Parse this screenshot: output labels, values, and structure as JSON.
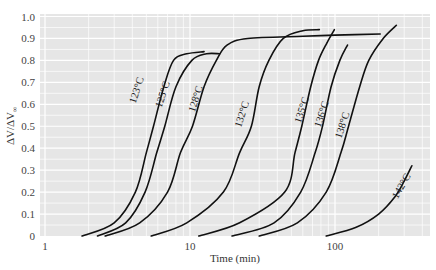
{
  "chart_data": {
    "type": "line",
    "title": "",
    "xlabel": "Time (min)",
    "ylabel": "ΔV/ΔV∞",
    "xscale": "log",
    "xlim": [
      0.92,
      490
    ],
    "ylim": [
      0,
      1.0
    ],
    "x_ticks": [
      {
        "value": 1,
        "label": "1"
      },
      {
        "value": 10,
        "label": "10"
      },
      {
        "value": 100,
        "label": "100"
      }
    ],
    "y_ticks": [
      {
        "value": 0,
        "label": "0"
      },
      {
        "value": 0.1,
        "label": "0.1"
      },
      {
        "value": 0.2,
        "label": "0.2"
      },
      {
        "value": 0.3,
        "label": "0.3"
      },
      {
        "value": 0.4,
        "label": "0.4"
      },
      {
        "value": 0.5,
        "label": "0.5"
      },
      {
        "value": 0.6,
        "label": "0.6"
      },
      {
        "value": 0.7,
        "label": "0.7"
      },
      {
        "value": 0.8,
        "label": "0.8"
      },
      {
        "value": 0.9,
        "label": "0.9"
      },
      {
        "value": 1.0,
        "label": "1.0"
      }
    ],
    "grid": true,
    "legend": "none (curves labeled inline)",
    "series": [
      {
        "name": "123°C",
        "label_pos": {
          "t": 4.5,
          "v": 0.66
        },
        "label_angle": -72,
        "points": [
          [
            1.8,
            0
          ],
          [
            3.0,
            0.06
          ],
          [
            4.2,
            0.2
          ],
          [
            5.0,
            0.38
          ],
          [
            5.6,
            0.5
          ],
          [
            6.6,
            0.68
          ],
          [
            7.7,
            0.8
          ],
          [
            9.5,
            0.83
          ],
          [
            12.5,
            0.84
          ]
        ]
      },
      {
        "name": "125°C",
        "label_pos": {
          "t": 6.8,
          "v": 0.64
        },
        "label_angle": -72,
        "points": [
          [
            2.3,
            0
          ],
          [
            3.6,
            0.06
          ],
          [
            4.9,
            0.2
          ],
          [
            5.9,
            0.38
          ],
          [
            6.7,
            0.5
          ],
          [
            8.0,
            0.68
          ],
          [
            10.3,
            0.8
          ],
          [
            13,
            0.83
          ],
          [
            16,
            0.83
          ]
        ]
      },
      {
        "name": "128°C",
        "label_pos": {
          "t": 11.5,
          "v": 0.62
        },
        "label_angle": -72,
        "points": [
          [
            2.6,
            0
          ],
          [
            4.5,
            0.06
          ],
          [
            7.0,
            0.2
          ],
          [
            8.6,
            0.38
          ],
          [
            10.4,
            0.5
          ],
          [
            12.5,
            0.68
          ],
          [
            15.2,
            0.8
          ],
          [
            18,
            0.87
          ],
          [
            25,
            0.9
          ],
          [
            60,
            0.91
          ],
          [
            100,
            0.915
          ],
          [
            205,
            0.92
          ]
        ]
      },
      {
        "name": "132°C",
        "label_pos": {
          "t": 24,
          "v": 0.55
        },
        "label_angle": -72,
        "points": [
          [
            5.4,
            0
          ],
          [
            9.5,
            0.06
          ],
          [
            17,
            0.2
          ],
          [
            22,
            0.38
          ],
          [
            26.5,
            0.5
          ],
          [
            30,
            0.68
          ],
          [
            35,
            0.8
          ],
          [
            44,
            0.9
          ],
          [
            60,
            0.935
          ],
          [
            78,
            0.94
          ]
        ]
      },
      {
        "name": "135°C",
        "label_pos": {
          "t": 62,
          "v": 0.57
        },
        "label_angle": -72,
        "points": [
          [
            11.5,
            0
          ],
          [
            22,
            0.06
          ],
          [
            45,
            0.2
          ],
          [
            53,
            0.38
          ],
          [
            59,
            0.5
          ],
          [
            68,
            0.68
          ],
          [
            77,
            0.8
          ],
          [
            88,
            0.88
          ],
          [
            99,
            0.94
          ]
        ]
      },
      {
        "name": "136°C",
        "label_pos": {
          "t": 85,
          "v": 0.55
        },
        "label_angle": -72,
        "points": [
          [
            19.5,
            0
          ],
          [
            38,
            0.06
          ],
          [
            58,
            0.2
          ],
          [
            73,
            0.38
          ],
          [
            82,
            0.5
          ],
          [
            94,
            0.68
          ],
          [
            108,
            0.8
          ],
          [
            122,
            0.87
          ]
        ]
      },
      {
        "name": "138°C",
        "label_pos": {
          "t": 118,
          "v": 0.5
        },
        "label_angle": -72,
        "points": [
          [
            30,
            0
          ],
          [
            55,
            0.06
          ],
          [
            87,
            0.2
          ],
          [
            110,
            0.38
          ],
          [
            124,
            0.5
          ],
          [
            148,
            0.68
          ],
          [
            171,
            0.8
          ],
          [
            215,
            0.9
          ],
          [
            265,
            0.96
          ]
        ]
      },
      {
        "name": "142°C",
        "label_pos": {
          "t": 300,
          "v": 0.22
        },
        "label_angle": -60,
        "points": [
          [
            87,
            0
          ],
          [
            140,
            0.04
          ],
          [
            200,
            0.1
          ],
          [
            260,
            0.18
          ],
          [
            300,
            0.25
          ],
          [
            339,
            0.32
          ]
        ]
      }
    ]
  },
  "axes": {
    "xlabel": "Time (min)",
    "ylabel_main": "ΔV/ΔV",
    "ylabel_sub": "∞"
  }
}
